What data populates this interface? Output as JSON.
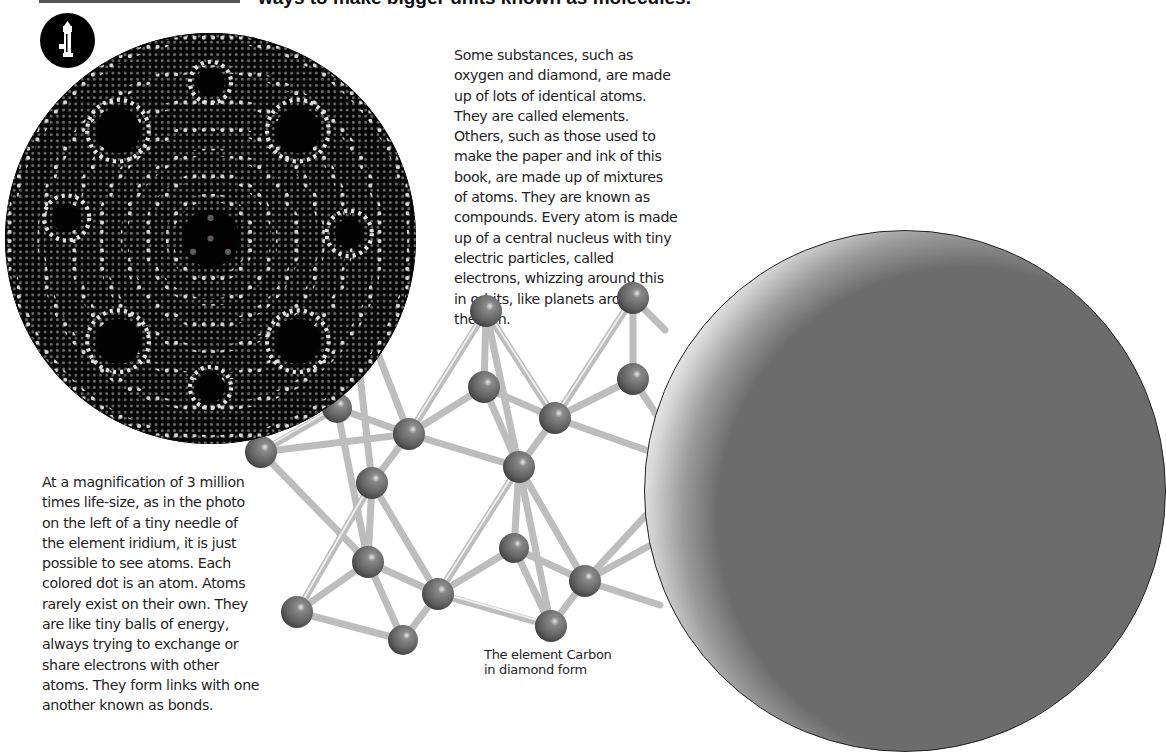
{
  "header": {
    "headline_tail": "ways to make bigger units known as molecules."
  },
  "paragraphs": {
    "right": [
      "Some substances, such as",
      "oxygen and diamond, are made",
      "up of lots of identical atoms.",
      "They are called elements.",
      "Others, such as those used to",
      "make the paper and ink of this",
      "book, are made up of mixtures",
      "of atoms. They are known as",
      "compounds. Every atom is made",
      "up of a central nucleus with tiny",
      "electric particles, called",
      "electrons, whizzing around this",
      "in orbits, like planets around",
      "the Sun."
    ],
    "left": [
      "At a magnification of 3 million",
      "times life-size, as in the photo",
      "on the left of a tiny needle of",
      "the element iridium, it is just",
      "possible to see atoms. Each",
      "colored dot is an atom. Atoms",
      "rarely exist on their own. They",
      "are like tiny balls of energy,",
      "always trying to exchange or",
      "share electrons with other",
      "atoms. They form links with one",
      "another known as bonds."
    ]
  },
  "caption": {
    "lines": [
      "The element Carbon",
      "in diamond form"
    ]
  },
  "icons": {
    "badge": "microscope-icon"
  },
  "colors": {
    "atom": "#6e6e6e",
    "bond": "#d0d0d0",
    "photo_bg": "#050505",
    "rule": "#555555"
  }
}
